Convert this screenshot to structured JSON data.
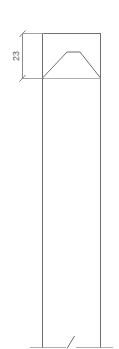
{
  "drawing": {
    "type": "mechanical-elevation-view",
    "title": "Part elevation view",
    "background_color": "#ffffff",
    "line_color": "#6e6e6e",
    "thin_line_color": "#9a9a9a",
    "text_color": "#5a5a5a",
    "dimensions": [
      {
        "id": "height-of-top-feature",
        "value": "23",
        "orientation": "vertical",
        "text_rotation_deg": -90,
        "units_shown": false,
        "from_y": 33,
        "to_y": 78,
        "measured_span_px": 45
      }
    ],
    "geometry": {
      "body": {
        "name": "main-shaft",
        "left_x": 42,
        "right_x": 101,
        "top_y": 33,
        "bottom_y": 347,
        "width_px": 59
      },
      "top_feature": {
        "name": "chamfered-trapezoid",
        "base_left_x": 42,
        "base_right_x": 101,
        "base_y": 78,
        "apex_left_x": 67,
        "apex_right_x": 80,
        "apex_y": 52
      },
      "base_line": {
        "name": "ground-baseline",
        "y": 347,
        "left_x": 30,
        "right_x": 113
      },
      "break_mark": {
        "name": "diagonal-break-tick",
        "x1": 67,
        "y1": 348,
        "x2": 74,
        "y2": 336
      }
    }
  },
  "labels": {
    "dimension_23": "23"
  }
}
